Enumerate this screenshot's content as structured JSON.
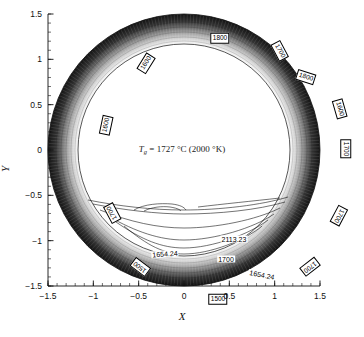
{
  "figure": {
    "type": "contour-plot",
    "center_annotation": {
      "symbol": "T",
      "subscript": "g",
      "text": " = 1727 °C (2000 °K)"
    }
  },
  "axes": {
    "x": {
      "label": "X",
      "min": -1.5,
      "max": 1.5,
      "ticks": [
        "-1.5",
        "-1",
        "-0.5",
        "0",
        "0.5",
        "1",
        "1.5"
      ],
      "tick_values": [
        -1.5,
        -1,
        -0.5,
        0,
        0.5,
        1,
        1.5
      ],
      "minor_tick_step": 0.1
    },
    "y": {
      "label": "Y",
      "min": -1.5,
      "max": 1.5,
      "ticks": [
        "1.5",
        "1",
        "0.5",
        "0",
        "-0.5",
        "-1",
        "-1.5"
      ],
      "tick_values": [
        1.5,
        1,
        0.5,
        0,
        -0.5,
        -1,
        -1.5
      ],
      "minor_tick_step": 0.1
    }
  },
  "chart_data": {
    "type": "contour",
    "title": "",
    "xlabel": "X",
    "ylabel": "Y",
    "xlim": [
      -1.5,
      1.5
    ],
    "ylim": [
      -1.5,
      1.5
    ],
    "grid": false,
    "legend": "none",
    "domain": {
      "shape": "annulus",
      "inner_radius": 1.17,
      "outer_radius": 1.5,
      "description": "Temperature field over a ring-shaped (annular) region; shading is dark at the outer radius and fades to white at the inner radius."
    },
    "shading": {
      "outer_color": "#1a1a1a",
      "inner_color": "#ffffff",
      "description": "Dense packed contour lines create a gradient from black at outer wall to white at inner wall."
    },
    "contour_levels": [
      1500,
      1600,
      1700,
      1800,
      1654.24,
      2113.23
    ],
    "ring_labels": [
      {
        "text": "1800",
        "x": 172,
        "y": 24,
        "rot": 0,
        "boxed": true
      },
      {
        "text": "1700",
        "x": 232,
        "y": 37,
        "rot": 62,
        "boxed": true
      },
      {
        "text": "1600",
        "x": 98,
        "y": 49,
        "rot": -58,
        "boxed": true
      },
      {
        "text": "1800",
        "x": 258,
        "y": 63,
        "rot": 18,
        "boxed": true
      },
      {
        "text": "1600",
        "x": 292,
        "y": 95,
        "rot": 74,
        "boxed": true
      },
      {
        "text": "1600",
        "x": 58,
        "y": 111,
        "rot": -78,
        "boxed": true
      },
      {
        "text": "1700",
        "x": 298,
        "y": 135,
        "rot": 90,
        "boxed": true
      },
      {
        "text": "1700",
        "x": 64,
        "y": 199,
        "rot": -118,
        "boxed": true
      },
      {
        "text": "1700",
        "x": 291,
        "y": 202,
        "rot": 118,
        "boxed": true
      },
      {
        "text": "1500",
        "x": 92,
        "y": 253,
        "rot": -143,
        "boxed": true
      },
      {
        "text": "1700",
        "x": 262,
        "y": 253,
        "rot": 142,
        "boxed": true
      },
      {
        "text": "1500",
        "x": 170,
        "y": 285,
        "rot": 0,
        "boxed": true
      }
    ],
    "inner_labels": [
      {
        "text": "2113.23",
        "x": 186,
        "y": 225,
        "rot": 0,
        "boxed": false
      },
      {
        "text": "1654.24",
        "x": 117,
        "y": 240,
        "rot": -4,
        "boxed": false
      },
      {
        "text": "1700",
        "x": 178,
        "y": 245,
        "rot": 0,
        "boxed": false
      },
      {
        "text": "1654.24",
        "x": 214,
        "y": 261,
        "rot": 11,
        "boxed": false
      }
    ]
  },
  "colors": {
    "axis": "#111111",
    "contour_line": "#000000",
    "background": "#ffffff",
    "label_box_border": "#000000"
  }
}
